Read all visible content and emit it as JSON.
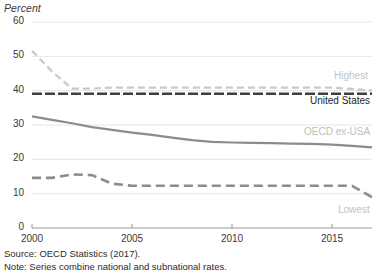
{
  "chart_data": {
    "type": "line",
    "title": "",
    "subtitle": "",
    "ylabel": "Percent",
    "xlabel": "",
    "ylim": [
      0,
      60
    ],
    "xlim": [
      2000,
      2017
    ],
    "grid": true,
    "legend_position": "right-inline",
    "yticks": [
      0,
      10,
      20,
      30,
      40,
      50,
      60
    ],
    "ytick_labels": [
      "0",
      "10",
      "20",
      "30",
      "40",
      "50",
      "60"
    ],
    "xticks": [
      2000,
      2005,
      2010,
      2015
    ],
    "xtick_labels": [
      "2000",
      "2005",
      "2010",
      "2015"
    ],
    "x": [
      2000,
      2001,
      2002,
      2003,
      2004,
      2005,
      2006,
      2007,
      2008,
      2009,
      2010,
      2011,
      2012,
      2013,
      2014,
      2015,
      2016,
      2017
    ],
    "series": [
      {
        "name": "Highest",
        "style": "dashed",
        "color": "#c9c9c9",
        "values": [
          51.6,
          45.6,
          40.6,
          40.6,
          40.9,
          40.9,
          40.9,
          40.9,
          40.9,
          40.9,
          40.9,
          40.9,
          40.9,
          40.9,
          40.9,
          40.9,
          40.5,
          40.0
        ]
      },
      {
        "name": "United States",
        "style": "dashed",
        "color": "#3f3f3f",
        "values": [
          39.1,
          39.1,
          39.1,
          39.1,
          39.1,
          39.1,
          39.1,
          39.1,
          39.1,
          39.1,
          39.1,
          39.1,
          39.1,
          39.1,
          39.1,
          39.1,
          39.1,
          39.1
        ]
      },
      {
        "name": "OECD ex-USA",
        "style": "solid",
        "color": "#8c8c8c",
        "values": [
          32.5,
          31.5,
          30.5,
          29.4,
          28.6,
          27.8,
          27.1,
          26.3,
          25.6,
          25.1,
          24.9,
          24.8,
          24.7,
          24.6,
          24.5,
          24.3,
          23.9,
          23.5
        ]
      },
      {
        "name": "Lowest",
        "style": "dashed",
        "color": "#8c8c8c",
        "values": [
          14.6,
          14.6,
          15.6,
          15.4,
          12.9,
          12.3,
          12.3,
          12.3,
          12.3,
          12.3,
          12.3,
          12.3,
          12.3,
          12.3,
          12.3,
          12.3,
          12.3,
          9.0
        ]
      }
    ]
  },
  "labels": {
    "percent": "Percent",
    "highest": "Highest",
    "united_states": "United States",
    "oecd_ex_usa": "OECD ex-USA",
    "lowest": "Lowest"
  },
  "notes": {
    "source": "Source: OECD Statistics (2017).",
    "method": "Note: Series combine national and subnational rates."
  },
  "colors": {
    "highest": "#c9c9c9",
    "united_states": "#3f3f3f",
    "oecd_ex_usa": "#8c8c8c",
    "lowest": "#8c8c8c",
    "grid": "#e6e6e6",
    "axis": "#999999",
    "text": "#3a3a3a"
  }
}
